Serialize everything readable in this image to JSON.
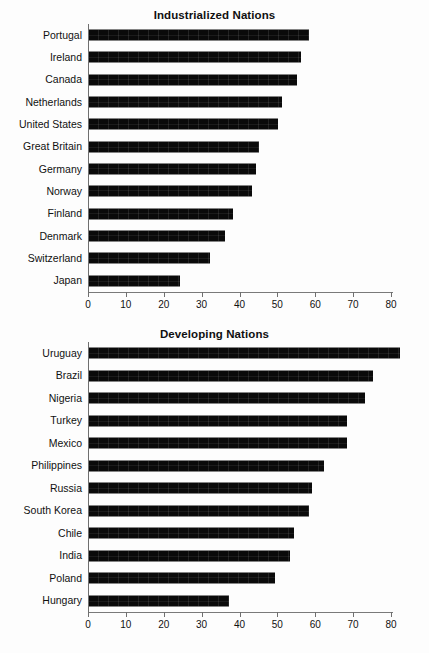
{
  "chart_data": [
    {
      "type": "bar",
      "orientation": "horizontal",
      "title": "Industrialized Nations",
      "xlabel": "",
      "ylabel": "",
      "xlim": [
        0,
        85
      ],
      "ticks": [
        0,
        10,
        20,
        30,
        40,
        50,
        60,
        70,
        80
      ],
      "grid": false,
      "legend": "none",
      "bar_color": "#0a0a0a",
      "categories": [
        "Portugal",
        "Ireland",
        "Canada",
        "Netherlands",
        "United States",
        "Great Britain",
        "Germany",
        "Norway",
        "Finland",
        "Denmark",
        "Switzerland",
        "Japan"
      ],
      "values": [
        58,
        56,
        55,
        51,
        50,
        45,
        44,
        43,
        38,
        36,
        32,
        24
      ]
    },
    {
      "type": "bar",
      "orientation": "horizontal",
      "title": "Developing Nations",
      "xlabel": "",
      "ylabel": "",
      "xlim": [
        0,
        85
      ],
      "ticks": [
        0,
        10,
        20,
        30,
        40,
        50,
        60,
        70,
        80
      ],
      "grid": false,
      "legend": "none",
      "bar_color": "#0a0a0a",
      "categories": [
        "Uruguay",
        "Brazil",
        "Nigeria",
        "Turkey",
        "Mexico",
        "Philippines",
        "Russia",
        "South Korea",
        "Chile",
        "India",
        "Poland",
        "Hungary"
      ],
      "values": [
        82,
        75,
        73,
        68,
        68,
        62,
        59,
        58,
        54,
        53,
        49,
        37
      ]
    }
  ]
}
